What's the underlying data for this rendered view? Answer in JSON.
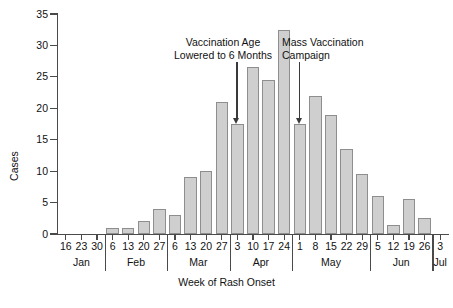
{
  "chart_data": {
    "type": "bar",
    "title": "",
    "xlabel": "Week of Rash Onset",
    "ylabel": "Cases",
    "ylim": [
      0,
      35
    ],
    "yticks": [
      0,
      5,
      10,
      15,
      20,
      25,
      30,
      35
    ],
    "grid": false,
    "legend": null,
    "categories": [
      "Jan 16",
      "Jan 23",
      "Jan 30",
      "Feb 6",
      "Feb 13",
      "Feb 20",
      "Feb 27",
      "Mar 6",
      "Mar 13",
      "Mar 20",
      "Mar 27",
      "Apr 3",
      "Apr 10",
      "Apr 17",
      "Apr 24",
      "May 1",
      "May 8",
      "May 15",
      "May 22",
      "May 29",
      "Jun 5",
      "Jun 12",
      "Jun 19",
      "Jun 26",
      "Jul 3"
    ],
    "values": [
      0,
      0,
      0,
      1,
      1,
      2,
      4,
      3,
      9,
      10,
      21,
      17.5,
      26.5,
      24.5,
      32.5,
      17.5,
      22,
      19,
      13.5,
      9.5,
      6,
      1.5,
      5.5,
      2.5,
      0
    ],
    "tick_labels": [
      "16",
      "23",
      "30",
      "6",
      "13",
      "20",
      "27",
      "6",
      "13",
      "20",
      "27",
      "3",
      "10",
      "17",
      "24",
      "1",
      "8",
      "15",
      "22",
      "29",
      "5",
      "12",
      "19",
      "26",
      "3"
    ],
    "months": [
      {
        "name": "Jan",
        "weeks": 3
      },
      {
        "name": "Feb",
        "weeks": 4
      },
      {
        "name": "Mar",
        "weeks": 4
      },
      {
        "name": "Apr",
        "weeks": 4
      },
      {
        "name": "May",
        "weeks": 5
      },
      {
        "name": "Jun",
        "weeks": 4
      },
      {
        "name": "Jul",
        "weeks": 1
      }
    ],
    "annotations": [
      {
        "text": "Vaccination Age\nLowered to 6 Months",
        "target_category": "Apr 3"
      },
      {
        "text": "Mass Vaccination\nCampaign",
        "target_category": "May 1"
      }
    ],
    "colors": {
      "bar_fill": "#cfcfcf",
      "bar_stroke": "#8e8e8e",
      "axis": "#4a4a4a",
      "text": "#111111"
    }
  }
}
